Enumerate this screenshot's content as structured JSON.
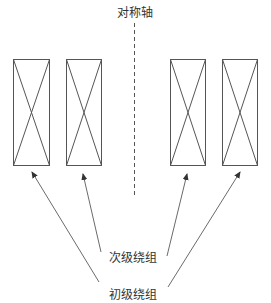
{
  "diagram": {
    "axis_label": "对称轴",
    "secondary_label": "次级绕组",
    "primary_label": "初级绕组",
    "line_color": "#555555",
    "background": "#ffffff",
    "boxes": [
      {
        "id": "left-outer",
        "x": 13,
        "y": 59,
        "w": 36,
        "h": 106,
        "winding": "primary"
      },
      {
        "id": "left-inner",
        "x": 66,
        "y": 59,
        "w": 35,
        "h": 106,
        "winding": "secondary"
      },
      {
        "id": "right-inner",
        "x": 170,
        "y": 59,
        "w": 35,
        "h": 106,
        "winding": "secondary"
      },
      {
        "id": "right-outer",
        "x": 222,
        "y": 59,
        "w": 35,
        "h": 106,
        "winding": "primary"
      }
    ]
  }
}
